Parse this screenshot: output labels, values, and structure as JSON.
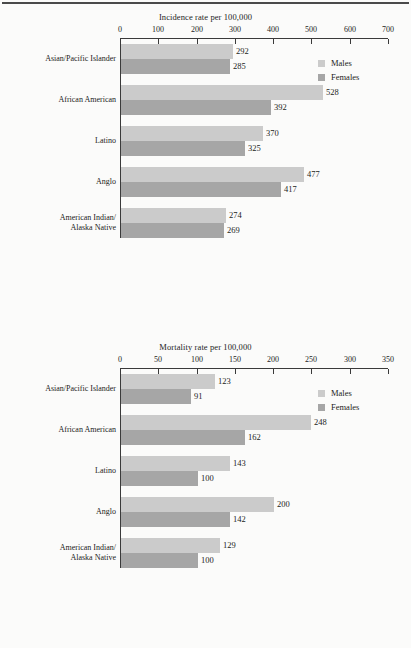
{
  "page": {
    "rule_color": "#4a4a4a",
    "background": "#fbfbfa"
  },
  "palette": {
    "males": "#cbcbcb",
    "females": "#a6a6a6",
    "axis": "#3a3a3a",
    "text": "#1b1b1b"
  },
  "legend": {
    "males_label": "Males",
    "females_label": "Females"
  },
  "chart_data": [
    {
      "type": "bar",
      "orientation": "horizontal",
      "title": "Incidence rate per 100,000",
      "xlabel": "",
      "ylabel": "",
      "xlim": [
        0,
        700
      ],
      "xticks": [
        0,
        100,
        200,
        300,
        400,
        500,
        600,
        700
      ],
      "xtick_labels": [
        "0",
        "100",
        "200",
        "300",
        "400",
        "500",
        "600",
        "700"
      ],
      "grid": false,
      "legend_position": "top-right",
      "categories": [
        "Asian/Pacific Islander",
        "African American",
        "Latino",
        "Anglo",
        "American Indian/\nAlaska Native"
      ],
      "series": [
        {
          "name": "Males",
          "color": "#cbcbcb",
          "values": [
            292,
            528,
            370,
            477,
            274
          ]
        },
        {
          "name": "Females",
          "color": "#a6a6a6",
          "values": [
            285,
            392,
            325,
            417,
            269
          ]
        }
      ]
    },
    {
      "type": "bar",
      "orientation": "horizontal",
      "title": "Mortality rate per 100,000",
      "xlabel": "",
      "ylabel": "",
      "xlim": [
        0,
        350
      ],
      "xticks": [
        0,
        50,
        100,
        150,
        200,
        250,
        300,
        350
      ],
      "xtick_labels": [
        "0",
        "50",
        "100",
        "150",
        "200",
        "250",
        "300",
        "350"
      ],
      "grid": false,
      "legend_position": "top-right",
      "categories": [
        "Asian/Pacific Islander",
        "African American",
        "Latino",
        "Anglo",
        "American Indian/\nAlaska Native"
      ],
      "series": [
        {
          "name": "Males",
          "color": "#cbcbcb",
          "values": [
            123,
            248,
            143,
            200,
            129
          ]
        },
        {
          "name": "Females",
          "color": "#a6a6a6",
          "values": [
            91,
            162,
            100,
            142,
            100
          ]
        }
      ]
    }
  ]
}
